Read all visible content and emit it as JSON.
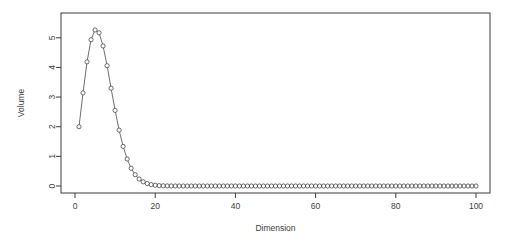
{
  "chart_data": {
    "type": "line",
    "title": "",
    "subtitle": "",
    "xlabel": "Dimension",
    "ylabel": "Volume",
    "xlim": [
      1,
      100
    ],
    "ylim": [
      0,
      5.6
    ],
    "xticks": [
      0,
      20,
      40,
      60,
      80,
      100
    ],
    "xtick_labels": [
      "0",
      "20",
      "40",
      "60",
      "80",
      "100"
    ],
    "yticks": [
      0,
      1,
      2,
      3,
      4,
      5
    ],
    "ytick_labels": [
      "0",
      "1",
      "2",
      "3",
      "4",
      "5"
    ],
    "grid": false,
    "legend": null,
    "marker": "open-circle",
    "line_style": "solid-thin",
    "series_color": "#3d3d3d",
    "box_color": "#3d3d3d",
    "background": "#ffffff",
    "annotations": [],
    "series": [
      {
        "name": "Volume of unit n-ball",
        "x": [
          1,
          2,
          3,
          4,
          5,
          6,
          7,
          8,
          9,
          10,
          11,
          12,
          13,
          14,
          15,
          16,
          17,
          18,
          19,
          20,
          21,
          22,
          23,
          24,
          25,
          26,
          27,
          28,
          29,
          30,
          31,
          32,
          33,
          34,
          35,
          36,
          37,
          38,
          39,
          40,
          41,
          42,
          43,
          44,
          45,
          46,
          47,
          48,
          49,
          50,
          51,
          52,
          53,
          54,
          55,
          56,
          57,
          58,
          59,
          60,
          61,
          62,
          63,
          64,
          65,
          66,
          67,
          68,
          69,
          70,
          71,
          72,
          73,
          74,
          75,
          76,
          77,
          78,
          79,
          80,
          81,
          82,
          83,
          84,
          85,
          86,
          87,
          88,
          89,
          90,
          91,
          92,
          93,
          94,
          95,
          96,
          97,
          98,
          99,
          100
        ],
        "values": [
          2.0,
          3.1416,
          4.1888,
          4.9348,
          5.2638,
          5.1677,
          4.7248,
          4.0587,
          3.2985,
          2.5502,
          1.8841,
          1.3353,
          0.9107,
          0.5993,
          0.3814,
          0.2353,
          0.1409,
          0.0822,
          0.0466,
          0.0258,
          0.014,
          0.0074,
          0.0038,
          0.0019,
          0.001,
          0.0005,
          0.0002,
          0.0001,
          6e-05,
          3e-05,
          1.4e-05,
          7e-06,
          3e-06,
          1.5e-06,
          7e-07,
          3e-07,
          1.5e-07,
          7e-08,
          3e-08,
          1.5e-08,
          0.0,
          0.0,
          0.0,
          0.0,
          0.0,
          0.0,
          0.0,
          0.0,
          0.0,
          0.0,
          0.0,
          0.0,
          0.0,
          0.0,
          0.0,
          0.0,
          0.0,
          0.0,
          0.0,
          0.0,
          0.0,
          0.0,
          0.0,
          0.0,
          0.0,
          0.0,
          0.0,
          0.0,
          0.0,
          0.0,
          0.0,
          0.0,
          0.0,
          0.0,
          0.0,
          0.0,
          0.0,
          0.0,
          0.0,
          0.0,
          0.0,
          0.0,
          0.0,
          0.0,
          0.0,
          0.0,
          0.0,
          0.0,
          0.0,
          0.0,
          0.0,
          0.0,
          0.0,
          0.0,
          0.0,
          0.0,
          0.0,
          0.0,
          0.0,
          0.0
        ]
      }
    ]
  },
  "layout": {
    "plot_left": 61,
    "plot_right": 490,
    "plot_top": 13,
    "plot_bottom": 193,
    "x_axis_title_y": 231,
    "y_axis_title_x": 24
  }
}
